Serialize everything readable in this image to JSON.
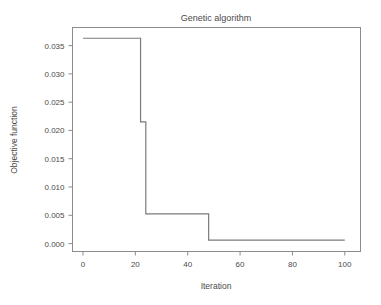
{
  "chart_data": {
    "type": "line",
    "title": "Genetic algorithm",
    "xlabel": "Iteration",
    "ylabel": "Objective function",
    "xlim": [
      -4,
      106
    ],
    "ylim": [
      -0.0014,
      0.0382
    ],
    "grid": false,
    "legend": null,
    "style": "step-post",
    "xticks": [
      0,
      20,
      40,
      60,
      80,
      100
    ],
    "xtick_labels": [
      "0",
      "20",
      "40",
      "60",
      "80",
      "100"
    ],
    "yticks": [
      0.0,
      0.005,
      0.01,
      0.015,
      0.02,
      0.025,
      0.03,
      0.035
    ],
    "ytick_labels": [
      "0.000",
      "0.005",
      "0.010",
      "0.015",
      "0.020",
      "0.025",
      "0.030",
      "0.035"
    ],
    "series": [
      {
        "name": "Best objective value",
        "color": "#7b7b7b",
        "x": [
          0,
          22,
          22,
          24,
          24,
          48,
          48,
          100
        ],
        "y": [
          0.0363,
          0.0363,
          0.0215,
          0.0215,
          0.00525,
          0.00525,
          0.0006,
          0.0006
        ]
      }
    ],
    "steps": [
      {
        "from_iteration": 0,
        "to_iteration": 22,
        "value": 0.0363
      },
      {
        "from_iteration": 22,
        "to_iteration": 24,
        "value": 0.0215
      },
      {
        "from_iteration": 24,
        "to_iteration": 48,
        "value": 0.00525
      },
      {
        "from_iteration": 48,
        "to_iteration": 100,
        "value": 0.0006
      }
    ]
  },
  "colors": {
    "background": "#ffffff",
    "line": "#7b7b7b",
    "axis": "#8c8c8c",
    "text": "#4a4a4a"
  }
}
